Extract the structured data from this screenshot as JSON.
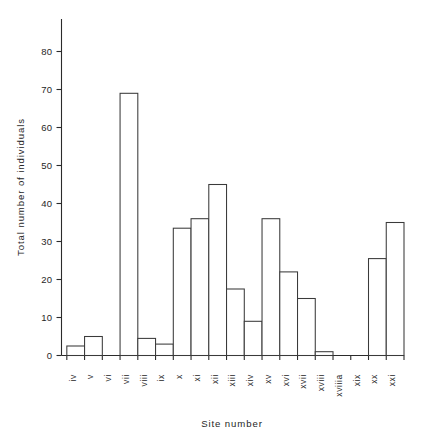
{
  "chart_data": {
    "type": "bar",
    "title": "",
    "xlabel": "Site number",
    "ylabel": "Total number of individuals",
    "categories": [
      "iv",
      "v",
      "vi",
      "vii",
      "viii",
      "ix",
      "x",
      "xi",
      "xii",
      "xiii",
      "xiv",
      "xv",
      "xvi",
      "xvii",
      "xviii",
      "xviiia",
      "xix",
      "xx",
      "xxi"
    ],
    "values": [
      2.5,
      5,
      0,
      69,
      4.5,
      3,
      33.5,
      36,
      45,
      17.5,
      9,
      36,
      22,
      15,
      1,
      0,
      0,
      25.5,
      35
    ],
    "ylim": [
      0,
      88
    ],
    "xlim": [
      0,
      19
    ],
    "ytick_values": [
      0,
      10,
      20,
      30,
      40,
      50,
      60,
      70,
      80
    ],
    "ytick_labels": [
      "0",
      "10",
      "20",
      "30",
      "40",
      "50",
      "60",
      "70",
      "80"
    ],
    "grid": false,
    "legend": null,
    "legend_position": "none",
    "bar_style": "open-outline",
    "bar_fill_color": "#ffffff",
    "bar_edge_color": "#3a3a3a",
    "axis_color": "#2b2b2b",
    "xtick_label_rotation": 90,
    "note": "Histogram-style contiguous open bars; categories vi, xviiia and xix have zero counts"
  },
  "figure": {
    "background_color": "#ffffff",
    "y_axis_title": "Total number of individuals",
    "x_axis_title": "Site number"
  }
}
